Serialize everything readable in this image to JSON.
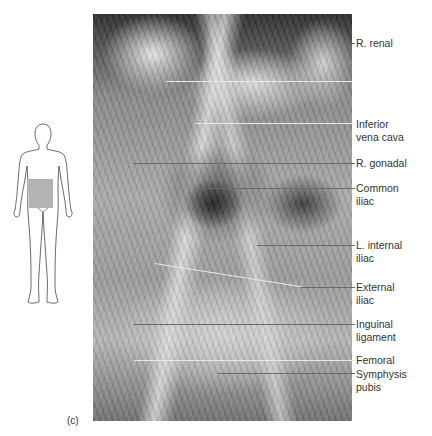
{
  "figure": {
    "part_label": "(c)",
    "photo_description": "Grayscale cadaver dissection photograph of abdominal and pelvic blood vessels",
    "orientation_figure": {
      "description": "Outline of human body, anterior view",
      "highlight_region": "pelvis",
      "highlight_color": "#b3b3b3"
    },
    "labels": [
      {
        "text": "R. renal",
        "y": 37
      },
      {
        "text": "Inferior\nvena cava",
        "y": 123
      },
      {
        "text": "R. gonadal",
        "y": 163
      },
      {
        "text": "Common\niliac",
        "y": 188
      },
      {
        "text": "L. internal\niliac",
        "y": 245
      },
      {
        "text": "External\niliac",
        "y": 287
      },
      {
        "text": "Inguinal\nligament",
        "y": 324
      },
      {
        "text": "Femoral",
        "y": 360
      },
      {
        "text": "Symphysis\npubis",
        "y": 373
      }
    ]
  }
}
